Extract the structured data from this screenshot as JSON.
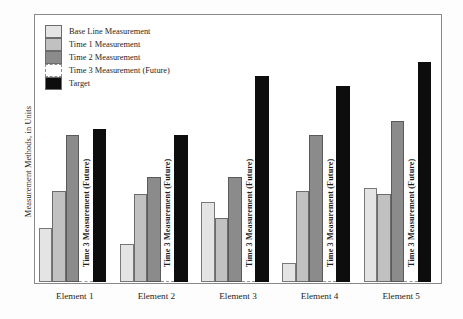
{
  "chart_data": {
    "type": "bar",
    "title": "",
    "subtitle": "",
    "xlabel": "",
    "ylabel": "Measurement Methods, in Units",
    "ylim": [
      0,
      100
    ],
    "grid": false,
    "legend_position": "top-left",
    "categories": [
      "Element 1",
      "Element 2",
      "Element 3",
      "Element 4",
      "Element 5"
    ],
    "series": [
      {
        "name": "Base Line Measurement",
        "color": "#e4e4e4",
        "values": [
          20,
          14,
          30,
          7,
          35
        ]
      },
      {
        "name": "Time 1 Measurement",
        "color": "#c1c1c1",
        "values": [
          34,
          33,
          24,
          34,
          33
        ]
      },
      {
        "name": "Time 2 Measurement",
        "color": "#8b8b8b",
        "values": [
          55,
          39,
          39,
          55,
          60
        ]
      },
      {
        "name": "Time 3 Measurement (Future)",
        "color": "#ffffff",
        "values": [
          0,
          0,
          0,
          0,
          0
        ],
        "in_bar_label": "Time 3 Measurement (Future)"
      },
      {
        "name": "Target",
        "color": "#0d0d0d",
        "values": [
          57,
          55,
          77,
          73,
          82
        ]
      }
    ],
    "annotations": [
      "Time 3 Measurement (Future)",
      "Time 3 Measurement (Future)",
      "Time 3 Measurement (Future)",
      "Time 3 Measurement (Future)",
      "Time 3 Measurement (Future)"
    ]
  },
  "legend": {
    "items": [
      {
        "label": "Base Line Measurement",
        "color": "#e4e4e4",
        "style": "solid"
      },
      {
        "label": "Time 1 Measurement",
        "color": "#c1c1c1",
        "style": "solid"
      },
      {
        "label": "Time 2 Measurement",
        "color": "#8b8b8b",
        "style": "solid"
      },
      {
        "label": "Time 3 Measurement (Future)",
        "color": "#ffffff",
        "style": "dashed"
      },
      {
        "label": "Target",
        "color": "#0d0d0d",
        "style": "solid"
      }
    ]
  },
  "axes": {
    "y_title": "Measurement Methods, in Units",
    "x_ticks": [
      "Element 1",
      "Element 2",
      "Element 3",
      "Element 4",
      "Element 5"
    ]
  },
  "colors": {
    "frame": "#8c8a88",
    "background": "#fdfdfd",
    "plot_background": "#ffffff",
    "text": "#262626"
  }
}
